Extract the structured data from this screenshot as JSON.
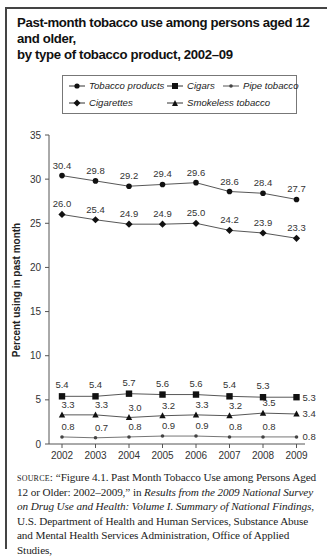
{
  "title": "Past-month tobacco use among persons aged 12 and older, by type of tobacco product, 2002–09",
  "title_lines": [
    "Past-month tobacco use among persons aged 12 and older,",
    "by type of tobacco product, 2002–09"
  ],
  "legend": {
    "items": [
      {
        "label": "Tobacco products",
        "marker": "circle"
      },
      {
        "label": "Cigars",
        "marker": "square"
      },
      {
        "label": "Pipe tobacco",
        "marker": "asterisk"
      },
      {
        "label": "Cigarettes",
        "marker": "diamond"
      },
      {
        "label": "Smokeless tobacco",
        "marker": "triangle"
      }
    ]
  },
  "chart_data": {
    "type": "line",
    "title": "Past-month tobacco use among persons aged 12 and older, by type of tobacco product, 2002–09",
    "xlabel": "",
    "ylabel": "Percent using in past month",
    "x": [
      "2002",
      "2003",
      "2004",
      "2005",
      "2006",
      "2007",
      "2008",
      "2009"
    ],
    "ylim": [
      0,
      35
    ],
    "yticks": [
      0,
      5,
      10,
      15,
      20,
      25,
      30,
      35
    ],
    "grid": false,
    "legend_position": "top",
    "series": [
      {
        "name": "Tobacco products",
        "marker": "circle",
        "values": [
          30.4,
          29.8,
          29.2,
          29.4,
          29.6,
          28.6,
          28.4,
          27.7
        ]
      },
      {
        "name": "Cigarettes",
        "marker": "diamond",
        "values": [
          26.0,
          25.4,
          24.9,
          24.9,
          25.0,
          24.2,
          23.9,
          23.3
        ]
      },
      {
        "name": "Cigars",
        "marker": "square",
        "values": [
          5.4,
          5.4,
          5.7,
          5.6,
          5.6,
          5.4,
          5.3,
          5.3
        ]
      },
      {
        "name": "Smokeless tobacco",
        "marker": "triangle",
        "values": [
          3.3,
          3.3,
          3.0,
          3.2,
          3.3,
          3.2,
          3.5,
          3.4
        ]
      },
      {
        "name": "Pipe tobacco",
        "marker": "asterisk",
        "values": [
          0.8,
          0.7,
          0.8,
          0.9,
          0.9,
          0.8,
          0.8,
          0.8
        ]
      }
    ]
  },
  "source": {
    "prefix": "source:",
    "part1": " “Figure 4.1. Past Month Tobacco Use among Persons Aged 12 or Older: 2002–2009,” in ",
    "italic": "Results from the 2009 National Survey on Drug Use and Health: Volume I. Summary of National Findings",
    "part2": ", U.S. Department of Health and Human Services, Substance Abuse and Mental Health Services Administration, Office of Applied Studies,"
  }
}
